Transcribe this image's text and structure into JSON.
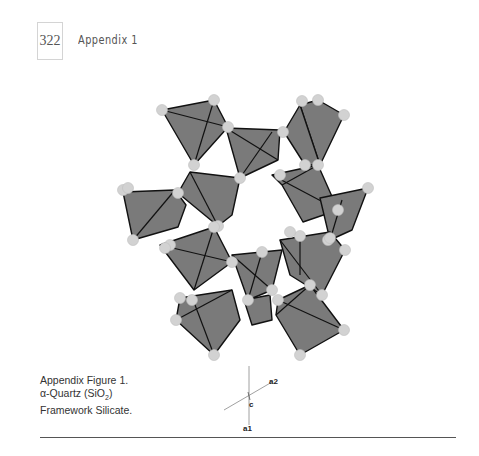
{
  "header": {
    "page_number": "322",
    "running_head": "Appendix 1"
  },
  "figure": {
    "caption_line1": "Appendix Figure 1.",
    "caption_alpha": "α",
    "caption_line2_rest": "-Quartz (SiO",
    "caption_subscript": "2",
    "caption_close": ")",
    "caption_line3": "Framework Silicate.",
    "axes": {
      "a1": "a1",
      "a2": "a2",
      "c": "c"
    },
    "colors": {
      "tetrahedron_fill": "#7a7a7a",
      "tetrahedron_edge": "#111111",
      "oxygen_atom": "#d2d2d2"
    }
  }
}
